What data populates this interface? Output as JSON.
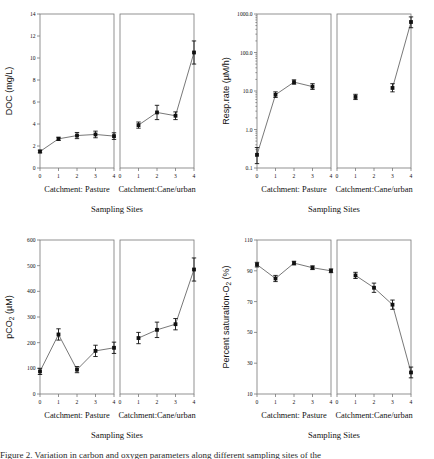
{
  "figure": {
    "caption_partial": "Figure 2. Variation in carbon and oxygen parameters along different sampling sites of the"
  },
  "common": {
    "xtitle": "Sampling Sites",
    "group_left_label": "Catchment: Pasture",
    "group_right_label": "Catchment:Cane/urban",
    "xticks": [
      "0",
      "1",
      "2",
      "3",
      "4"
    ]
  },
  "chart_data": [
    {
      "id": "doc",
      "type": "line",
      "title": "",
      "ylabel": "DOC (mg/L)",
      "xlabel": "Sampling Sites",
      "scale": "linear",
      "ylim": [
        0,
        14
      ],
      "yticks": [
        0,
        2,
        4,
        6,
        8,
        10,
        12,
        14
      ],
      "yticklabels": [
        "0",
        "2",
        "4",
        "6",
        "8",
        "10",
        "12",
        "14"
      ],
      "grid": false,
      "legend": "none",
      "series": [
        {
          "name": "Catchment: Pasture",
          "x": [
            0,
            1,
            2,
            3,
            4
          ],
          "values": [
            1.5,
            2.65,
            2.95,
            3.05,
            2.9
          ],
          "err": [
            0.12,
            0.15,
            0.28,
            0.3,
            0.3
          ]
        },
        {
          "name": "Catchment:Cane/urban",
          "x": [
            1,
            2,
            3,
            4
          ],
          "values": [
            3.9,
            5.05,
            4.75,
            10.5
          ],
          "err": [
            0.28,
            0.65,
            0.35,
            1.05
          ]
        }
      ]
    },
    {
      "id": "resp",
      "type": "line",
      "title": "",
      "ylabel": "Resp.rate (µM/h)",
      "xlabel": "Sampling Sites",
      "scale": "log",
      "ylim": [
        0.1,
        1000
      ],
      "yticks": [
        0.1,
        1,
        10,
        100,
        1000
      ],
      "yticklabels": [
        "0.1",
        "1.0",
        "10.0",
        "100.0",
        "1000.0"
      ],
      "grid": false,
      "legend": "none",
      "series": [
        {
          "name": "Catchment: Pasture",
          "x": [
            0,
            1,
            2,
            3
          ],
          "values": [
            0.22,
            8.0,
            17.0,
            13.0
          ],
          "err_low": [
            0.09,
            1.2,
            2.0,
            2.0
          ],
          "err_high": [
            0.12,
            1.5,
            2.5,
            2.5
          ]
        },
        {
          "name": "Catchment:Cane/urban",
          "x": [
            1
          ],
          "values": [
            7.0
          ],
          "err_low": [
            1.0
          ],
          "err_high": [
            1.2
          ]
        },
        {
          "name": "Catchment:Cane/urban (3-4)",
          "x": [
            3,
            4
          ],
          "values": [
            12.0,
            620.0
          ],
          "err_low": [
            2.5,
            180.0
          ],
          "err_high": [
            3.5,
            220.0
          ]
        }
      ]
    },
    {
      "id": "pco2",
      "type": "line",
      "title": "",
      "ylabel": "pCO2 (µM)",
      "ylabel_sub": "2",
      "xlabel": "Sampling Sites",
      "scale": "linear",
      "ylim": [
        0,
        600
      ],
      "yticks": [
        0,
        100,
        200,
        300,
        400,
        500,
        600
      ],
      "yticklabels": [
        "0",
        "100",
        "200",
        "300",
        "400",
        "500",
        "600"
      ],
      "grid": false,
      "legend": "none",
      "series": [
        {
          "name": "Catchment: Pasture",
          "x": [
            0,
            1,
            2,
            3,
            4
          ],
          "values": [
            88,
            232,
            95,
            168,
            180
          ],
          "err": [
            12,
            22,
            12,
            22,
            22
          ]
        },
        {
          "name": "Catchment:Cane/urban",
          "x": [
            1,
            2,
            3,
            4
          ],
          "values": [
            218,
            250,
            272,
            485
          ],
          "err": [
            22,
            30,
            22,
            45
          ]
        }
      ]
    },
    {
      "id": "sat",
      "type": "line",
      "title": "",
      "ylabel": "Percent saturation-O2 (%)",
      "ylabel_sub": "2",
      "xlabel": "Sampling Sites",
      "scale": "linear",
      "ylim": [
        10,
        110
      ],
      "yticks": [
        10,
        30,
        50,
        70,
        90,
        110
      ],
      "yticklabels": [
        "10",
        "30",
        "50",
        "70",
        "90",
        "110"
      ],
      "grid": false,
      "legend": "none",
      "series": [
        {
          "name": "Catchment: Pasture",
          "x": [
            0,
            1,
            2,
            3,
            4
          ],
          "values": [
            94,
            85,
            95,
            92,
            90
          ],
          "err": [
            1.5,
            2.0,
            1.2,
            1.2,
            1.2
          ]
        },
        {
          "name": "Catchment:Cane/urban",
          "x": [
            1,
            2,
            3,
            4
          ],
          "values": [
            87,
            79,
            68,
            24
          ],
          "err": [
            2.0,
            3.0,
            3.0,
            3.5
          ]
        }
      ]
    }
  ]
}
